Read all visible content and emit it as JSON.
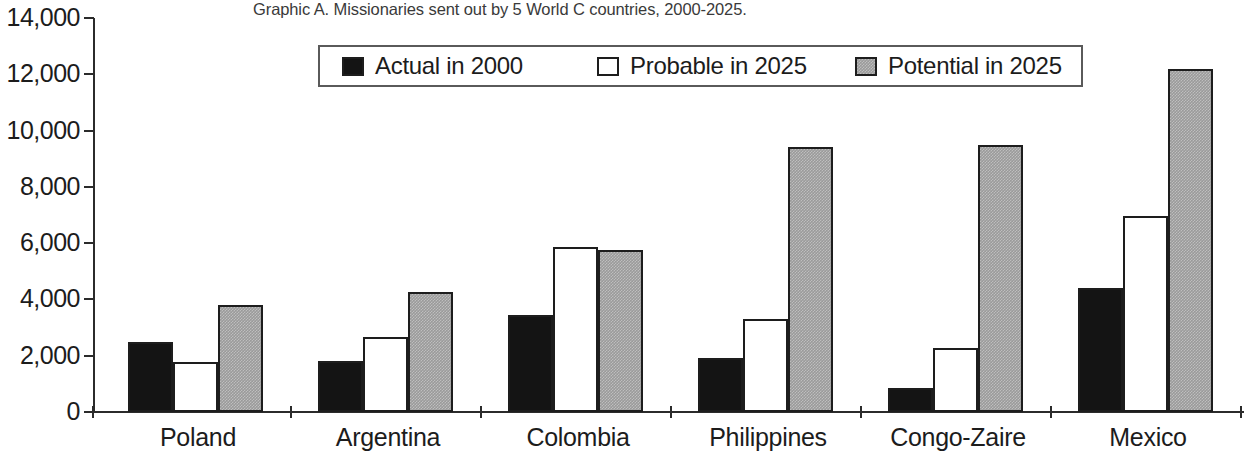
{
  "chart_data": {
    "type": "bar",
    "title": "Graphic A. Missionaries sent out by 5 World C countries, 2000-2025.",
    "xlabel": "",
    "ylabel": "",
    "ylim": [
      0,
      14000
    ],
    "ytick_labels": [
      "0",
      "2,000",
      "4,000",
      "6,000",
      "8,000",
      "10,000",
      "12,000",
      "14,000"
    ],
    "ytick_values": [
      0,
      2000,
      4000,
      6000,
      8000,
      10000,
      12000,
      14000
    ],
    "grid": false,
    "legend_position": "top-center",
    "categories": [
      "Poland",
      "Argentina",
      "Colombia",
      "Philippines",
      "Congo-Zaire",
      "Mexico"
    ],
    "series": [
      {
        "name": "Actual in 2000",
        "key": "actual",
        "color": "#141414",
        "values": [
          2500,
          1800,
          3450,
          1920,
          850,
          4400
        ]
      },
      {
        "name": "Probable in 2025",
        "key": "probable",
        "color": "#ffffff",
        "values": [
          1780,
          2650,
          5870,
          3300,
          2280,
          6950
        ]
      },
      {
        "name": "Potential in 2025",
        "key": "potential",
        "color": "#9a9a9a",
        "values": [
          3800,
          4250,
          5760,
          9400,
          9470,
          12200
        ]
      }
    ]
  },
  "legend": {
    "items": [
      {
        "label": "Actual in 2000",
        "swatch": "black-square-icon"
      },
      {
        "label": "Probable in 2025",
        "swatch": "white-square-icon"
      },
      {
        "label": "Potential in 2025",
        "swatch": "gray-square-icon"
      }
    ]
  }
}
